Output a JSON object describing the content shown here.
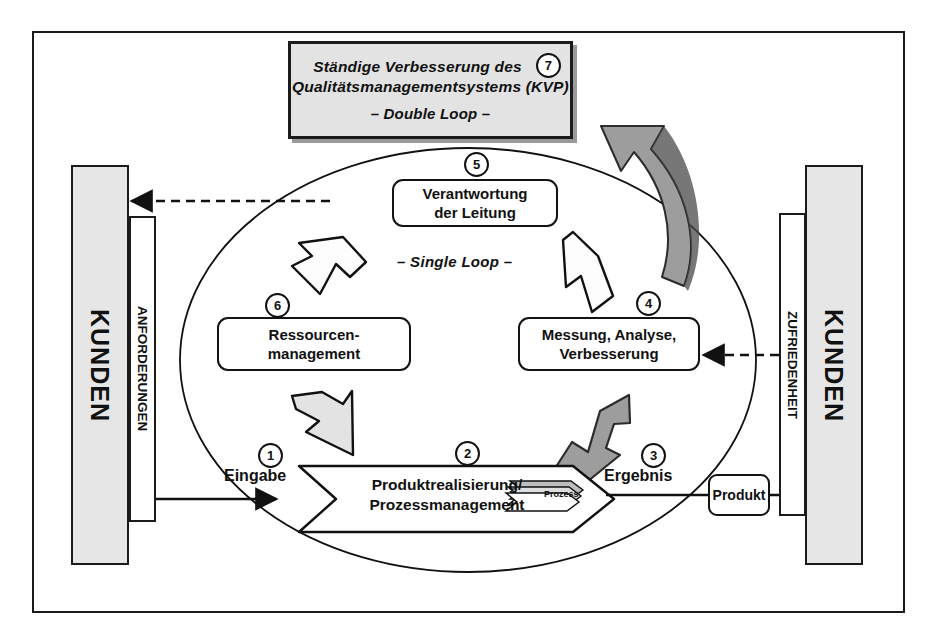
{
  "diagram": {
    "kvp_box": {
      "line1": "Ständige Verbesserung des",
      "line2": "Qualitätsmanagementsystems (KVP)",
      "line3": "– Double Loop –",
      "number": "7"
    },
    "loop_label": "– Single Loop –",
    "left_customer": {
      "bar_label": "KUNDEN",
      "sub_label": "ANFORDERUNGEN"
    },
    "right_customer": {
      "bar_label": "KUNDEN",
      "sub_label": "ZUFRIEDENHEIT"
    },
    "nodes": [
      {
        "id": "verantwortung",
        "label_line1": "Verantwortung",
        "label_line2": "der Leitung",
        "number": "5"
      },
      {
        "id": "ressourcenmanagement",
        "label_line1": "Ressourcen-",
        "label_line2": "management",
        "number": "6"
      },
      {
        "id": "messung",
        "label_line1": "Messung, Analyse,",
        "label_line2": "Verbesserung",
        "number": "4"
      },
      {
        "id": "produktrealisierung",
        "label_line1": "Produktrealisierung/",
        "label_line2": "Prozessmanagement",
        "number": "2"
      }
    ],
    "flow": {
      "input_label": "Eingabe",
      "input_number": "1",
      "output_label": "Ergebnis",
      "output_number": "3",
      "process_stack_label": "Prozess",
      "product_label": "Produkt"
    },
    "colors": {
      "frame": "#1a1a1a",
      "customer_bar_fill": "#e6e6e6",
      "kvp_fill": "#e3e3e3",
      "gray_arrow": "#9d9d9d",
      "light_arrow": "#e3e3e3",
      "shadow": "#9a9a9a"
    }
  }
}
